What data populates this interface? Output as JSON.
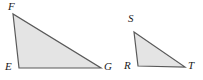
{
  "figure": {
    "type": "geometry-diagram",
    "width": 203,
    "height": 80,
    "background_color": "#ffffff",
    "fill_color": "#e4e4e4",
    "stroke_color": "#595959",
    "label_color": "#1a1a1a",
    "stroke_width": 1.2,
    "shapes": [
      {
        "name": "triangle-efg",
        "label": "Triangle EFG",
        "points": "13,14 19,68 101,68",
        "vertices": [
          {
            "name": "F",
            "x": 13,
            "y": 14,
            "label_x": 8,
            "label_y": 1
          },
          {
            "name": "E",
            "x": 19,
            "y": 68,
            "label_x": 5,
            "label_y": 61
          },
          {
            "name": "G",
            "x": 101,
            "y": 68,
            "label_x": 104,
            "label_y": 61
          }
        ]
      },
      {
        "name": "triangle-rst",
        "label": "Triangle RST",
        "points": "134,32 138,66 185,67",
        "vertices": [
          {
            "name": "S",
            "x": 134,
            "y": 32,
            "label_x": 128,
            "label_y": 13
          },
          {
            "name": "R",
            "x": 138,
            "y": 66,
            "label_x": 124,
            "label_y": 60
          },
          {
            "name": "T",
            "x": 185,
            "y": 67,
            "label_x": 188,
            "label_y": 60
          }
        ]
      }
    ]
  }
}
